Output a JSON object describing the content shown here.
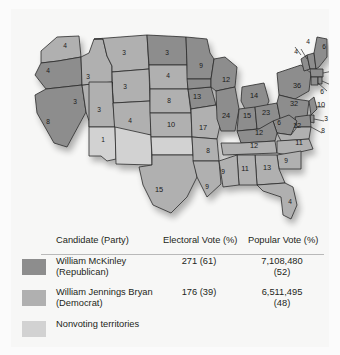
{
  "figure": {
    "background": "#fbfbfb",
    "panel_background": "#f7f7f6"
  },
  "colors": {
    "republican": "#8d8d8d",
    "democrat": "#b0b0b0",
    "nonvoting": "#d2d2d2",
    "water": "#f2f2f0",
    "border": "#2b2b2b",
    "text": "#231f20",
    "rule": "#b9b9b9"
  },
  "table": {
    "headers": {
      "candidate": "Candidate (Party)",
      "electoral": "Electoral Vote (%)",
      "popular": "Popular Vote (%)"
    },
    "rows": [
      {
        "swatch": "republican",
        "name_line1": "William McKinley",
        "name_line2": "(Republican)",
        "electoral_line1": "271 (61)",
        "electoral_line2": "",
        "popular_line1": "7,108,480",
        "popular_line2": "(52)"
      },
      {
        "swatch": "democrat",
        "name_line1": "William Jennings Bryan",
        "name_line2": "(Democrat)",
        "electoral_line1": "176 (39)",
        "electoral_line2": "",
        "popular_line1": "6,511,495",
        "popular_line2": "(48)"
      }
    ],
    "nonvoting_label": "Nonvoting territories"
  },
  "chart_data": {
    "type": "map",
    "legend": [
      "William McKinley (Republican)",
      "William Jennings Bryan (Democrat)",
      "Nonvoting territories"
    ],
    "totals": {
      "republican_electoral": 271,
      "republican_electoral_pct": 61,
      "republican_popular": 7108480,
      "republican_popular_pct": 52,
      "democrat_electoral": 176,
      "democrat_electoral_pct": 39,
      "democrat_popular": 6511495,
      "democrat_popular_pct": 48
    },
    "states": [
      {
        "code": "WA",
        "votes": 4,
        "party": "democrat",
        "x": 54,
        "y": 37
      },
      {
        "code": "OR",
        "votes": 4,
        "party": "republican",
        "x": 37,
        "y": 62
      },
      {
        "code": "ID",
        "votes": 3,
        "party": "democrat",
        "x": 77,
        "y": 68
      },
      {
        "code": "MT",
        "votes": 3,
        "party": "democrat",
        "x": 113,
        "y": 44
      },
      {
        "code": "ND",
        "votes": 3,
        "party": "republican",
        "x": 156,
        "y": 44
      },
      {
        "code": "SD",
        "votes": 4,
        "party": "democrat",
        "x": 157,
        "y": 67
      },
      {
        "code": "MN",
        "votes": 9,
        "party": "republican",
        "x": 190,
        "y": 57
      },
      {
        "code": "WI",
        "votes": 12,
        "party": "republican",
        "x": 215,
        "y": 71
      },
      {
        "code": "MI",
        "votes": 14,
        "party": "republican",
        "x": 243,
        "y": 87
      },
      {
        "code": "NY",
        "votes": 36,
        "party": "republican",
        "x": 286,
        "y": 77
      },
      {
        "code": "VT",
        "votes": 4,
        "party": "republican",
        "x": 285,
        "y": 43
      },
      {
        "code": "NH",
        "votes": 4,
        "party": "republican",
        "x": 297,
        "y": 33
      },
      {
        "code": "ME",
        "votes": 6,
        "party": "republican",
        "x": 313,
        "y": 38
      },
      {
        "code": "MA",
        "votes": 15,
        "party": "republican",
        "x": 325,
        "y": 64
      },
      {
        "code": "RI",
        "votes": 4,
        "party": "republican",
        "x": 322,
        "y": 78
      },
      {
        "code": "CT",
        "votes": 6,
        "party": "republican",
        "x": 311,
        "y": 83
      },
      {
        "code": "PA",
        "votes": 32,
        "party": "republican",
        "x": 283,
        "y": 95
      },
      {
        "code": "NJ",
        "votes": 10,
        "party": "republican",
        "x": 310,
        "y": 96
      },
      {
        "code": "DE",
        "votes": 3,
        "party": "republican",
        "x": 315,
        "y": 110
      },
      {
        "code": "MD",
        "votes": 8,
        "party": "republican",
        "x": 312,
        "y": 122
      },
      {
        "code": "OH",
        "votes": 23,
        "party": "republican",
        "x": 255,
        "y": 104
      },
      {
        "code": "IN",
        "votes": 15,
        "party": "republican",
        "x": 236,
        "y": 107
      },
      {
        "code": "IL",
        "votes": 24,
        "party": "republican",
        "x": 215,
        "y": 107
      },
      {
        "code": "IA",
        "votes": 13,
        "party": "republican",
        "x": 186,
        "y": 88
      },
      {
        "code": "NE",
        "votes": 8,
        "party": "democrat",
        "x": 158,
        "y": 92
      },
      {
        "code": "WY",
        "votes": 3,
        "party": "democrat",
        "x": 114,
        "y": 78
      },
      {
        "code": "UT",
        "votes": 3,
        "party": "democrat",
        "x": 88,
        "y": 101
      },
      {
        "code": "NV",
        "votes": 3,
        "party": "democrat",
        "x": 64,
        "y": 93
      },
      {
        "code": "CA",
        "votes": 8,
        "party": "republican",
        "x": 37,
        "y": 113
      },
      {
        "code": "CO",
        "votes": 4,
        "party": "democrat",
        "x": 119,
        "y": 112
      },
      {
        "code": "KS",
        "votes": 10,
        "party": "democrat",
        "x": 160,
        "y": 116
      },
      {
        "code": "MO",
        "votes": 17,
        "party": "democrat",
        "x": 192,
        "y": 119
      },
      {
        "code": "KY",
        "votes": 12,
        "party": "republican",
        "x": 248,
        "y": 124
      },
      {
        "code": "WV",
        "votes": 6,
        "party": "republican",
        "x": 268,
        "y": 114
      },
      {
        "code": "VA",
        "votes": 12,
        "party": "democrat",
        "x": 286,
        "y": 117
      },
      {
        "code": "NC",
        "votes": 11,
        "party": "democrat",
        "x": 288,
        "y": 134
      },
      {
        "code": "TN",
        "votes": 12,
        "party": "democrat",
        "x": 243,
        "y": 137
      },
      {
        "code": "SC",
        "votes": 9,
        "party": "democrat",
        "x": 275,
        "y": 152
      },
      {
        "code": "GA",
        "votes": 13,
        "party": "democrat",
        "x": 256,
        "y": 159
      },
      {
        "code": "AL",
        "votes": 11,
        "party": "democrat",
        "x": 234,
        "y": 160
      },
      {
        "code": "MS",
        "votes": 9,
        "party": "democrat",
        "x": 212,
        "y": 163
      },
      {
        "code": "AR",
        "votes": 8,
        "party": "democrat",
        "x": 197,
        "y": 142
      },
      {
        "code": "LA",
        "votes": 9,
        "party": "democrat",
        "x": 196,
        "y": 178
      },
      {
        "code": "TX",
        "votes": 15,
        "party": "democrat",
        "x": 148,
        "y": 181
      },
      {
        "code": "FL",
        "votes": 4,
        "party": "democrat",
        "x": 279,
        "y": 193
      },
      {
        "code": "OK",
        "votes": 1,
        "party": "nonvoting",
        "x": 92,
        "y": 131
      }
    ],
    "nonvoting_territories": [
      "Arizona Territory",
      "New Mexico Territory",
      "Oklahoma Territory",
      "Indian Territory"
    ]
  }
}
